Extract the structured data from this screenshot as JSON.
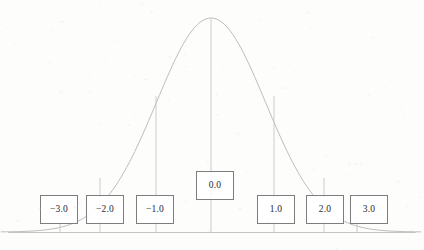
{
  "figure": {
    "background_color": "#fdfdfc",
    "curve_color": "#b9b9b9",
    "axis_color": "#c9c9c9",
    "box_border_color": "#7d7d7d",
    "label_text_color": "#3b3b3b"
  },
  "chart_data": {
    "type": "line",
    "title": "",
    "xlabel": "",
    "ylabel": "",
    "xlim": [
      -4.2,
      4.2
    ],
    "ylim": [
      0,
      1
    ],
    "grid": false,
    "legend": null,
    "categories": [
      "-3.0",
      "-2.0",
      "-1.0",
      "0.0",
      "1.0",
      "2.0",
      "3.0"
    ],
    "x": [
      -3,
      -2,
      -1,
      0,
      1,
      2,
      3
    ],
    "values": [
      0.011,
      0.135,
      0.607,
      1.0,
      0.607,
      0.135,
      0.011
    ],
    "series": [
      {
        "name": "standard normal density",
        "x": [
          -4.2,
          -3.5,
          -3.0,
          -2.5,
          -2.0,
          -1.5,
          -1.0,
          -0.5,
          0.0,
          0.5,
          1.0,
          1.5,
          2.0,
          2.5,
          3.0,
          3.5,
          4.2
        ],
        "values": [
          0.0001,
          0.0022,
          0.011,
          0.044,
          0.135,
          0.325,
          0.607,
          0.882,
          1.0,
          0.882,
          0.607,
          0.325,
          0.135,
          0.044,
          0.011,
          0.0022,
          0.0001
        ]
      }
    ],
    "tick_labels": [
      "-3.0",
      "-2.0",
      "-1.0",
      "0.0",
      "1.0",
      "2.0",
      "3.0"
    ]
  },
  "axis": {
    "baseline_label": "baseline"
  },
  "boxes": [
    {
      "id": "box-neg3",
      "label": "−3.0",
      "z": -3.0,
      "x": 40,
      "y": 195,
      "w": 38,
      "h": 29
    },
    {
      "id": "box-neg2",
      "label": "−2.0",
      "z": -2.0,
      "x": 86,
      "y": 195,
      "w": 38,
      "h": 29
    },
    {
      "id": "box-neg1",
      "label": "−1.0",
      "z": -1.0,
      "x": 136,
      "y": 195,
      "w": 38,
      "h": 29
    },
    {
      "id": "box-zero",
      "label": "0.0",
      "z": 0.0,
      "x": 196,
      "y": 171,
      "w": 38,
      "h": 29
    },
    {
      "id": "box-pos1",
      "label": "1.0",
      "z": 1.0,
      "x": 257,
      "y": 195,
      "w": 38,
      "h": 29
    },
    {
      "id": "box-pos2",
      "label": "2.0",
      "z": 2.0,
      "x": 306,
      "y": 195,
      "w": 38,
      "h": 29
    },
    {
      "id": "box-pos3",
      "label": "3.0",
      "z": 3.0,
      "x": 350,
      "y": 195,
      "w": 38,
      "h": 29
    }
  ],
  "drop_lines": [
    {
      "id": "drop-neg3",
      "z": -3.0,
      "x": 60,
      "y_top": 224
    },
    {
      "id": "drop-neg2",
      "z": -2.0,
      "x": 100,
      "y_top": 178
    },
    {
      "id": "drop-neg1",
      "z": -1.0,
      "x": 156,
      "y_top": 96
    },
    {
      "id": "drop-zero",
      "z": 0.0,
      "x": 211,
      "y_top": 19
    },
    {
      "id": "drop-pos1",
      "z": 1.0,
      "x": 274,
      "y_top": 96
    },
    {
      "id": "drop-pos2",
      "z": 2.0,
      "x": 324,
      "y_top": 178
    },
    {
      "id": "drop-pos3",
      "z": 3.0,
      "x": 357,
      "y_top": 224
    }
  ]
}
